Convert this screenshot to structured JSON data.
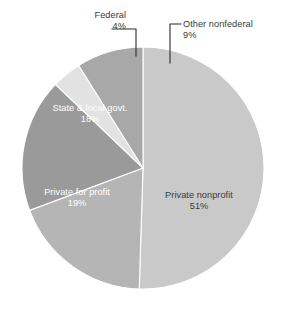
{
  "chart_data": {
    "type": "pie",
    "title": "",
    "categories": [
      "Private nonprofit",
      "Private for profit",
      "State & local govt.",
      "Federal",
      "Other nonfederal"
    ],
    "values": [
      51,
      19,
      18,
      4,
      9
    ],
    "value_labels": [
      "51%",
      "19%",
      "18%",
      "4%",
      "9%"
    ],
    "units": "percent",
    "start_angle_deg": 0,
    "direction": "clockwise",
    "legend": "none",
    "labels_position": "on-slice and callout",
    "colors": [
      "#c9c9c9",
      "#b5b5b5",
      "#9a9a9a",
      "#e2e2e2",
      "#a8a8a8"
    ],
    "slices": [
      {
        "name": "Private nonprofit",
        "value": 51,
        "label": "Private nonprofit",
        "pct_text": "51%",
        "color": "#c9c9c9",
        "label_placement": "inside",
        "label_color": "dark"
      },
      {
        "name": "Private for profit",
        "value": 19,
        "label": "Private for profit",
        "pct_text": "19%",
        "color": "#b5b5b5",
        "label_placement": "inside",
        "label_color": "light"
      },
      {
        "name": "State & local govt.",
        "value": 18,
        "label": "State & local govt.",
        "pct_text": "18%",
        "color": "#9a9a9a",
        "label_placement": "inside",
        "label_color": "light"
      },
      {
        "name": "Federal",
        "value": 4,
        "label": "Federal",
        "pct_text": "4%",
        "color": "#e2e2e2",
        "label_placement": "callout",
        "label_color": "dark"
      },
      {
        "name": "Other nonfederal",
        "value": 9,
        "label": "Other nonfederal",
        "pct_text": "9%",
        "color": "#a8a8a8",
        "label_placement": "callout",
        "label_color": "dark"
      }
    ]
  },
  "labels": {
    "federal": {
      "name": "Federal",
      "pct": "4%"
    },
    "other": {
      "name": "Other nonfederal",
      "pct": "9%"
    },
    "state": {
      "name": "State & local govt.",
      "pct": "18%"
    },
    "forprofit": {
      "name": "Private for profit",
      "pct": "19%"
    },
    "nonprofit": {
      "name": "Private nonprofit",
      "pct": "51%"
    }
  },
  "footer": {
    "caption": ""
  }
}
